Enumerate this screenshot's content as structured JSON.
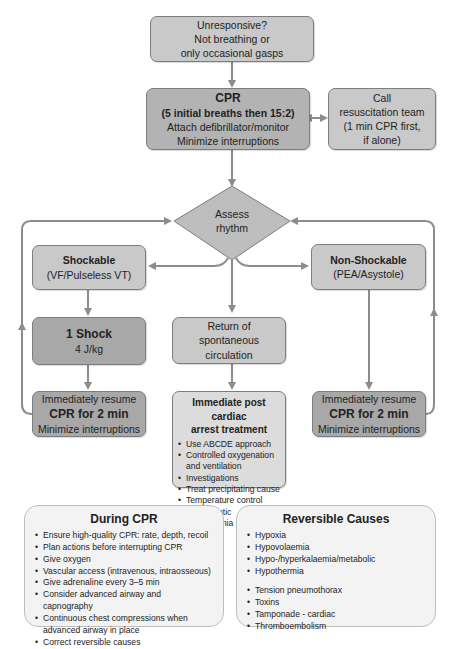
{
  "flowchart": {
    "start": {
      "lines": [
        "Unresponsive?",
        "Not breathing or",
        "only occasional gasps"
      ]
    },
    "cpr": {
      "title": "CPR",
      "subtitle": "(5 initial breaths then 15:2)",
      "line1": "Attach defibrillator/monitor",
      "line2": "Minimize interruptions"
    },
    "call_team": {
      "lines": [
        "Call",
        "resuscitation team",
        "(1 min CPR first,",
        "if alone)"
      ]
    },
    "assess": {
      "line1": "Assess",
      "line2": "rhythm"
    },
    "shockable": {
      "title": "Shockable",
      "subtitle": "(VF/Pulseless VT)"
    },
    "non_shockable": {
      "title": "Non-Shockable",
      "subtitle": "(PEA/Asystole)"
    },
    "shock": {
      "title": "1 Shock",
      "subtitle": "4 J/kg"
    },
    "rosc": {
      "lines": [
        "Return of",
        "spontaneous",
        "circulation"
      ]
    },
    "resume_left": {
      "line1": "Immediately resume",
      "line2": "CPR for 2 min",
      "line3": "Minimize interruptions"
    },
    "resume_right": {
      "line1": "Immediately resume",
      "line2": "CPR for 2 min",
      "line3": "Minimize interruptions"
    },
    "post_arrest": {
      "title1": "Immediate post cardiac",
      "title2": "arrest treatment",
      "items": [
        "Use ABCDE approach",
        "Controlled oxygenation and ventilation",
        "Investigations",
        "Treat precipitating cause",
        "Temperature control",
        "Therapeutic hypothermia"
      ]
    }
  },
  "during_cpr": {
    "title": "During CPR",
    "items": [
      "Ensure high-quality CPR: rate, depth, recoil",
      "Plan actions before interrupting CPR",
      "Give oxygen",
      "Vascular access (intravenous, intraosseous)",
      "Give adrenaline every 3–5 min",
      "Consider advanced airway and capnography",
      "Continuous chest compressions when advanced airway in place",
      "Correct reversible causes"
    ]
  },
  "reversible_causes": {
    "title": "Reversible Causes",
    "items": [
      "Hypoxia",
      "Hypovolaemia",
      "Hypo-/hyperkalaemia/metabolic",
      "Hypothermia",
      "Tension pneumothorax",
      "Toxins",
      "Tamponade - cardiac",
      "Thromboembolism"
    ]
  },
  "colors": {
    "connector": "#8c8c8c",
    "box_border": "#7d7d7d",
    "box_fill_light": "#c9c9c9",
    "box_fill_dark": "#a8a8a8",
    "panel_fill": "#f3f3f3"
  }
}
